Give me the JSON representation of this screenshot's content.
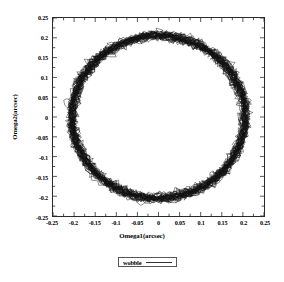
{
  "chart_data": {
    "type": "scatter",
    "title": "",
    "xlabel": "Omega1(arcsec)",
    "ylabel": "Omega2(arcsec)",
    "xlim": [
      -0.25,
      0.25
    ],
    "ylim": [
      -0.25,
      0.25
    ],
    "xticks": [
      "-0.25",
      "-0.2",
      "-0.15",
      "-0.1",
      "-0.05",
      "0",
      "0.05",
      "0.1",
      "0.15",
      "0.2",
      "0.25"
    ],
    "yticks": [
      "0.25",
      "0.2",
      "0.15",
      "0.1",
      "0.05",
      "0",
      "-0.05",
      "-0.1",
      "-0.15",
      "-0.2",
      "-0.25"
    ],
    "xtick_values": [
      -0.25,
      -0.2,
      -0.15,
      -0.1,
      -0.05,
      0,
      0.05,
      0.1,
      0.15,
      0.2,
      0.25
    ],
    "ytick_values": [
      0.25,
      0.2,
      0.15,
      0.1,
      0.05,
      0,
      -0.05,
      -0.1,
      -0.15,
      -0.2,
      -0.25
    ],
    "grid": false,
    "legend_position": "below-plot",
    "series": [
      {
        "name": "wobble",
        "color": "#111111",
        "description": "Dense noisy near-circular orbital track centered near the origin",
        "center": [
          0.0,
          0.0
        ],
        "mean_radius": 0.205,
        "radius_noise": 0.014,
        "n_revolutions": 40,
        "points_per_revolution": 220,
        "angular_jitter": 0.012
      }
    ],
    "annotations": []
  },
  "legend": {
    "label": "wobble"
  }
}
